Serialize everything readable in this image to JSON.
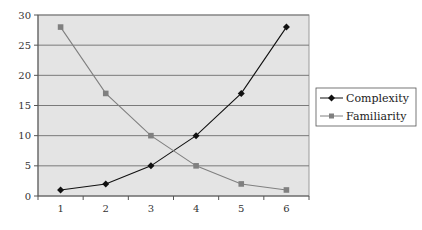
{
  "chart_data": {
    "type": "line",
    "title": "",
    "xlabel": "",
    "ylabel": "",
    "categories": [
      "1",
      "2",
      "3",
      "4",
      "5",
      "6"
    ],
    "series": [
      {
        "name": "Complexity",
        "values": [
          1,
          2,
          5,
          10,
          17,
          28
        ],
        "color": "#111111",
        "marker": "diamond"
      },
      {
        "name": "Familiarity",
        "values": [
          28,
          17,
          10,
          5,
          2,
          1
        ],
        "color": "#808080",
        "marker": "square"
      }
    ],
    "ylim": [
      0,
      30
    ],
    "yticks": [
      0,
      5,
      10,
      15,
      20,
      25,
      30
    ],
    "grid": true,
    "legend_position": "right",
    "plot_background": "#e4e4e4",
    "gridline_color": "#7a7a7a"
  }
}
